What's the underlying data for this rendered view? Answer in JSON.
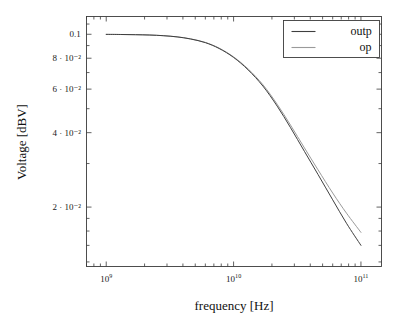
{
  "chart_data": {
    "type": "line",
    "title": "",
    "xlabel": "frequency [Hz]",
    "ylabel": "Voltage [dBV]",
    "xscale": "log",
    "yscale": "log",
    "xlim": [
      700000000.0,
      145000000000.0
    ],
    "ylim": [
      0.0115,
      0.118
    ],
    "grid": false,
    "legend_position": "top-right",
    "xticks": [
      {
        "value": 1000000000.0,
        "label_mantissa": "10",
        "label_exponent": "9"
      },
      {
        "value": 10000000000.0,
        "label_mantissa": "10",
        "label_exponent": "10"
      },
      {
        "value": 100000000000.0,
        "label_mantissa": "10",
        "label_exponent": "11"
      }
    ],
    "yticks": [
      {
        "value": 0.1,
        "label": "0.1"
      },
      {
        "value": 0.08,
        "label": "8 · 10⁻²"
      },
      {
        "value": 0.06,
        "label": "6 · 10⁻²"
      },
      {
        "value": 0.04,
        "label": "4 · 10⁻²"
      },
      {
        "value": 0.02,
        "label": "2 · 10⁻²"
      }
    ],
    "series": [
      {
        "name": "outp",
        "color": "#3f3f3f",
        "width": 1.0,
        "x": [
          1000000000.0,
          1300000000.0,
          1700000000.0,
          2200000000.0,
          2800000000.0,
          3600000000.0,
          4600000000.0,
          6000000000.0,
          7700000000.0,
          10000000000.0,
          13000000000.0,
          17000000000.0,
          22000000000.0,
          28000000000.0,
          36000000000.0,
          46000000000.0,
          60000000000.0,
          77000000000.0,
          100000000000.0
        ],
        "y": [
          0.0999,
          0.0998,
          0.0996,
          0.0993,
          0.0987,
          0.0976,
          0.0957,
          0.0925,
          0.0876,
          0.0806,
          0.0718,
          0.0617,
          0.0512,
          0.0419,
          0.0336,
          0.0271,
          0.0214,
          0.0172,
          0.014
        ]
      },
      {
        "name": "op",
        "color": "#9a9a9a",
        "width": 1.0,
        "x": [
          1000000000.0,
          1300000000.0,
          1700000000.0,
          2200000000.0,
          2800000000.0,
          3600000000.0,
          4600000000.0,
          6000000000.0,
          7700000000.0,
          10000000000.0,
          13000000000.0,
          17000000000.0,
          22000000000.0,
          28000000000.0,
          36000000000.0,
          46000000000.0,
          60000000000.0,
          77000000000.0,
          100000000000.0
        ],
        "y": [
          0.0999,
          0.0998,
          0.0996,
          0.0993,
          0.0987,
          0.0976,
          0.0958,
          0.0927,
          0.0879,
          0.081,
          0.0724,
          0.0625,
          0.0521,
          0.0429,
          0.0347,
          0.0283,
          0.0228,
          0.0189,
          0.0158
        ]
      }
    ]
  },
  "legend": {
    "entries": [
      {
        "label": "outp",
        "color": "#3f3f3f"
      },
      {
        "label": "op",
        "color": "#9a9a9a"
      }
    ]
  },
  "axes": {
    "x_title": "frequency [Hz]",
    "y_title": "Voltage [dBV]"
  },
  "style": {
    "frame_color": "#3b3b3b",
    "background": "#ffffff",
    "tick_color": "#3b3b3b"
  }
}
